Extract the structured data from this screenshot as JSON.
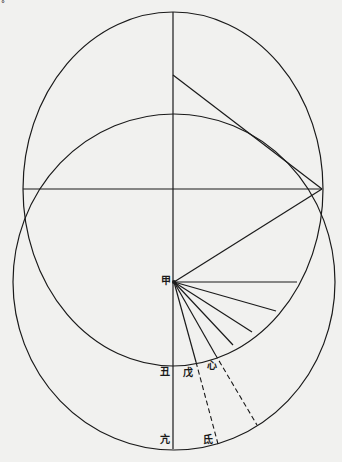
{
  "diagram": {
    "type": "geometric construction",
    "labels": {
      "jia": "甲",
      "chou": "丑",
      "wu": "戊",
      "xin": "心",
      "kang": "亢",
      "di": "氐"
    },
    "speck": "°",
    "colors": {
      "background": "#f1f1ef",
      "ink": "#1a1a1a"
    }
  }
}
